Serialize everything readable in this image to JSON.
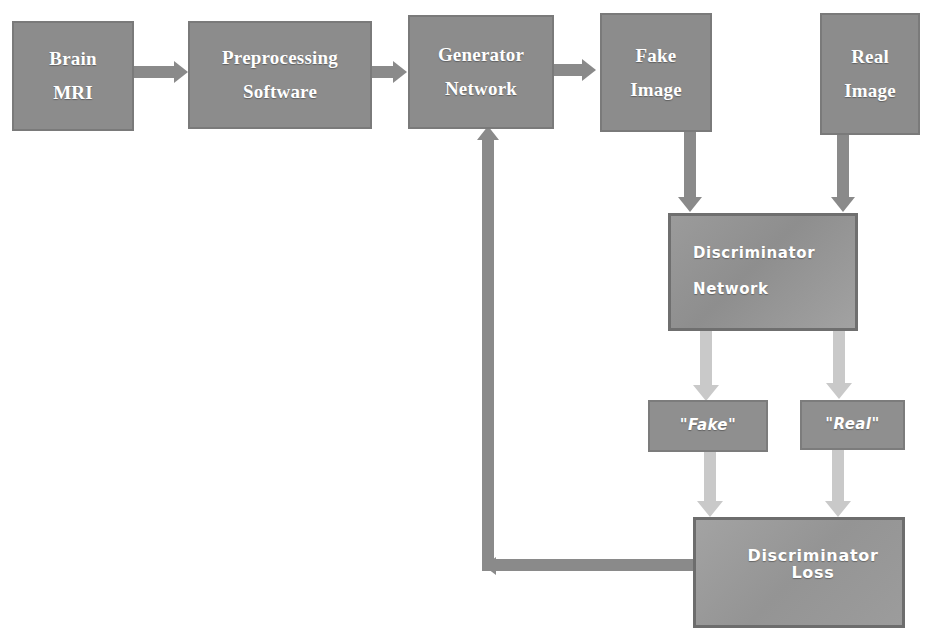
{
  "diagram": {
    "background_color": "#ffffff",
    "palette": {
      "box_gray": "#8c8c8c",
      "box_border": "#7a7a7a",
      "sans_box_gray": "#9b9b9b",
      "loss_box_gray": "#a3a3a3",
      "arrow_dark": "#8a8a8a",
      "arrow_light": "#c9c9c9",
      "text_on_box": "#ffffff"
    },
    "nodes": [
      {
        "id": "brain_mri",
        "lines": [
          "Brain",
          "MRI"
        ],
        "style": "serif"
      },
      {
        "id": "preprocessing",
        "lines": [
          "Preprocessing",
          "Software"
        ],
        "style": "serif"
      },
      {
        "id": "generator",
        "lines": [
          "Generator",
          "Network"
        ],
        "style": "serif"
      },
      {
        "id": "fake_image",
        "lines": [
          "Fake",
          "Image"
        ],
        "style": "serif"
      },
      {
        "id": "real_image",
        "lines": [
          "Real",
          "Image"
        ],
        "style": "serif"
      },
      {
        "id": "discriminator_network",
        "lines": [
          "Discriminator",
          "Network"
        ],
        "style": "sans"
      },
      {
        "id": "fake_label",
        "lines": [
          "\"Fake\""
        ],
        "style": "label"
      },
      {
        "id": "real_label",
        "lines": [
          "\"Real\""
        ],
        "style": "label"
      },
      {
        "id": "discriminator_loss",
        "lines": [
          "Discriminator Loss"
        ],
        "style": "loss"
      }
    ],
    "edges": [
      {
        "from": "brain_mri",
        "to": "preprocessing",
        "direction": "right",
        "tone": "dark"
      },
      {
        "from": "preprocessing",
        "to": "generator",
        "direction": "right",
        "tone": "dark"
      },
      {
        "from": "generator",
        "to": "fake_image",
        "direction": "right",
        "tone": "dark"
      },
      {
        "from": "fake_image",
        "to": "discriminator_network",
        "direction": "down",
        "tone": "dark"
      },
      {
        "from": "real_image",
        "to": "discriminator_network",
        "direction": "down",
        "tone": "dark"
      },
      {
        "from": "discriminator_network",
        "to": "fake_label",
        "direction": "down",
        "tone": "light"
      },
      {
        "from": "discriminator_network",
        "to": "real_label",
        "direction": "down",
        "tone": "light"
      },
      {
        "from": "fake_label",
        "to": "discriminator_loss",
        "direction": "down",
        "tone": "light"
      },
      {
        "from": "real_label",
        "to": "discriminator_loss",
        "direction": "down",
        "tone": "light"
      },
      {
        "from": "discriminator_loss",
        "to": "generator",
        "direction": "feedback-loop",
        "tone": "dark"
      }
    ]
  }
}
